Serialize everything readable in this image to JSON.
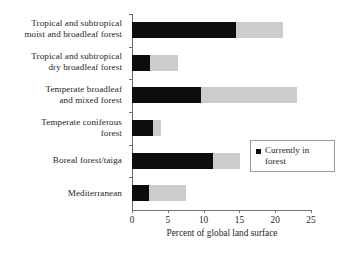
{
  "chart_data": {
    "type": "bar",
    "orientation": "horizontal",
    "stacked": true,
    "title": "",
    "xlabel": "Percent of global land surface",
    "ylabel": "",
    "xlim": [
      0,
      25
    ],
    "xticks": [
      0,
      5,
      10,
      15,
      20,
      25
    ],
    "xtick_labels": [
      "0",
      "5",
      "10",
      "15",
      "20",
      "25"
    ],
    "grid": false,
    "legend_position": "center-right",
    "categories": [
      "Tropical and subtropical moist and broadleaf forest",
      "Tropical and subtropical dry broadleaf forest",
      "Temperate broadleaf and mixed forest",
      "Temperate coniferous forest",
      "Boreal forest/taiga",
      "Mediterranean"
    ],
    "category_lines": [
      [
        "Tropical and subtropical",
        "moist and broadleaf forest"
      ],
      [
        "Tropical and subtropical",
        "dry broadleaf forest"
      ],
      [
        "Temperate broadleaf",
        "and mixed forest"
      ],
      [
        "Temperate coniferous",
        "forest"
      ],
      [
        "Boreal forest/taiga"
      ],
      [
        "Mediterranean"
      ]
    ],
    "series": [
      {
        "name": "Currently in forest",
        "color": "#0d0d0d",
        "values": [
          14.5,
          2.5,
          9.6,
          2.9,
          11.3,
          2.4
        ]
      },
      {
        "name": "Remaining extent",
        "color": "#cccccc",
        "values": [
          6.6,
          3.9,
          13.4,
          1.2,
          3.8,
          5.1
        ]
      }
    ],
    "totals": [
      21.1,
      6.4,
      23.0,
      4.1,
      15.1,
      7.5
    ]
  },
  "legend": {
    "entries": [
      {
        "label_line1": "Currently in",
        "label_line2": "forest",
        "color": "#0d0d0d"
      }
    ]
  },
  "colors": {
    "forest": "#0d0d0d",
    "remaining": "#cccccc",
    "axis": "#6f6f6f",
    "text": "#231f20",
    "background": "#ffffff"
  }
}
